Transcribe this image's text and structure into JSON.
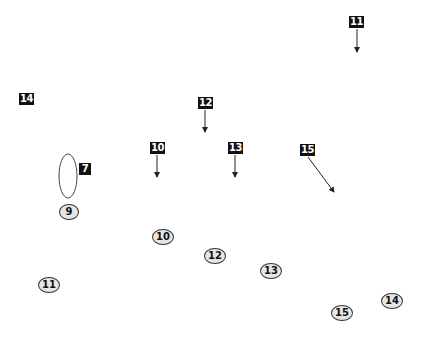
{
  "diagram": {
    "square_labels": [
      {
        "id": "11",
        "x": 349,
        "y": 16,
        "w": 14
      },
      {
        "id": "14",
        "x": 19,
        "y": 93,
        "w": 14
      },
      {
        "id": "12",
        "x": 198,
        "y": 97,
        "w": 14
      },
      {
        "id": "10",
        "x": 150,
        "y": 142,
        "w": 14
      },
      {
        "id": "13",
        "x": 228,
        "y": 142,
        "w": 14
      },
      {
        "id": "15",
        "x": 300,
        "y": 144,
        "w": 14
      },
      {
        "id": "7",
        "x": 79,
        "y": 163,
        "w": 12
      }
    ],
    "circle_labels": [
      {
        "id": "9",
        "x": 59,
        "y": 204,
        "w": 18
      },
      {
        "id": "10",
        "x": 152,
        "y": 229,
        "w": 20
      },
      {
        "id": "12",
        "x": 204,
        "y": 248,
        "w": 20
      },
      {
        "id": "13",
        "x": 260,
        "y": 263,
        "w": 20
      },
      {
        "id": "11",
        "x": 38,
        "y": 277,
        "w": 20
      },
      {
        "id": "14",
        "x": 381,
        "y": 293,
        "w": 20
      },
      {
        "id": "15",
        "x": 331,
        "y": 305,
        "w": 20
      }
    ],
    "arrows": [
      {
        "from": "11",
        "x1": 357,
        "y1": 29,
        "x2": 357,
        "y2": 52
      },
      {
        "from": "12",
        "x1": 205,
        "y1": 110,
        "x2": 205,
        "y2": 132
      },
      {
        "from": "10",
        "x1": 157,
        "y1": 155,
        "x2": 157,
        "y2": 177
      },
      {
        "from": "13",
        "x1": 235,
        "y1": 155,
        "x2": 235,
        "y2": 177
      },
      {
        "from": "15",
        "x1": 308,
        "y1": 157,
        "x2": 334,
        "y2": 192
      }
    ],
    "ellipse": {
      "cx": 68,
      "cy": 176,
      "rx": 9,
      "ry": 22
    }
  }
}
